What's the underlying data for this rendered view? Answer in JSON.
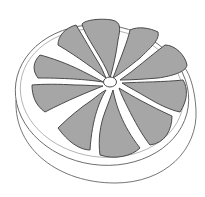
{
  "image": {
    "subject": "Halved grapefruit line drawing",
    "colors": {
      "background": "#ffffff",
      "segment_fill": "#a6a6a6",
      "outline": "#4a4a4a",
      "rind_line": "#666666",
      "center_hole": "#ffffff"
    },
    "segment_count": 10
  }
}
